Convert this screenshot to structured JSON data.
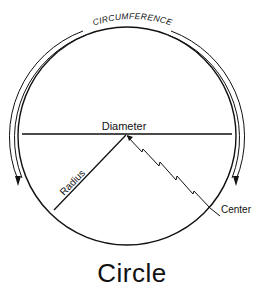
{
  "diagram": {
    "title": "Circle",
    "labels": {
      "circumference": "CIRCUMFERENCE",
      "diameter": "Diameter",
      "radius": "Radius",
      "center": "Center"
    },
    "colors": {
      "stroke": "#111111",
      "background": "#ffffff"
    }
  }
}
